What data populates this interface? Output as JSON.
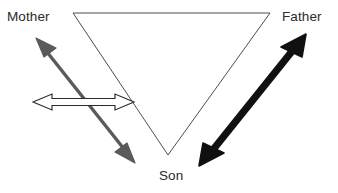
{
  "diagram": {
    "type": "relationship-triangle",
    "background_color": "#ffffff",
    "nodes": [
      {
        "id": "mother",
        "label": "Mother",
        "position": "top-left",
        "text_color": "#2b2b2b"
      },
      {
        "id": "father",
        "label": "Father",
        "position": "top-right",
        "text_color": "#2b2b2b"
      },
      {
        "id": "son",
        "label": "Son",
        "position": "bottom-center",
        "text_color": "#2b2b2b"
      }
    ],
    "triangle": {
      "name": "inverted-triangle-outline",
      "stroke_color": "#4d4d4d",
      "stroke_width": 1,
      "fill": "none",
      "vertices": [
        {
          "x": 73,
          "y": 13
        },
        {
          "x": 270,
          "y": 13
        },
        {
          "x": 168,
          "y": 155
        }
      ]
    },
    "arrows": [
      {
        "id": "mother-son-arrow",
        "label": "",
        "style": "gray-double-headed",
        "color": "#5a5a5a",
        "thickness": 3,
        "double_headed": true,
        "from": {
          "x": 36,
          "y": 38
        },
        "to": {
          "x": 135,
          "y": 163
        }
      },
      {
        "id": "father-son-arrow",
        "label": "",
        "style": "black-bold-double-headed",
        "color": "#101010",
        "thickness": 7,
        "double_headed": true,
        "from": {
          "x": 306,
          "y": 34
        },
        "to": {
          "x": 199,
          "y": 166
        }
      },
      {
        "id": "mother-father-arrow",
        "label": "",
        "style": "hollow-outline-double-headed",
        "color": "#ffffff",
        "stroke_color": "#2b2b2b",
        "thickness": 9,
        "double_headed": true,
        "from": {
          "x": 33,
          "y": 102
        },
        "to": {
          "x": 134,
          "y": 102
        }
      }
    ]
  }
}
